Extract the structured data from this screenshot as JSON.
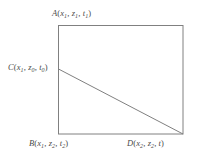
{
  "figure": {
    "type": "geometry-diagram",
    "background_color": "#ffffff",
    "stroke_color": "#808080",
    "text_color": "#4a4a4a",
    "width": 201,
    "height": 162,
    "rectangle": {
      "name": "bounding-rectangle",
      "left": 58,
      "top": 25,
      "right": 183,
      "bottom": 134,
      "stroke_width": 1
    },
    "diagonal": {
      "name": "diagonal-segment-CD",
      "from": {
        "point": "C",
        "x": 58,
        "y": 69
      },
      "to": {
        "point": "D",
        "x": 183,
        "y": 134
      },
      "stroke_width": 1
    },
    "vertices": [
      {
        "id": "A",
        "name": "vertex-label-A",
        "letter": "A",
        "position": "top-left-above",
        "coords": [
          {
            "var": "x",
            "sub": "1"
          },
          {
            "var": "z",
            "sub": "1"
          },
          {
            "var": "t",
            "sub": "1"
          }
        ],
        "text": "A(x1, z1, t1)"
      },
      {
        "id": "C",
        "name": "vertex-label-C",
        "letter": "C",
        "position": "left-edge",
        "coords": [
          {
            "var": "x",
            "sub": "1"
          },
          {
            "var": "z",
            "sub": "0"
          },
          {
            "var": "t",
            "sub": "0"
          }
        ],
        "text": "C(x1, z0, t0)"
      },
      {
        "id": "B",
        "name": "vertex-label-B",
        "letter": "B",
        "position": "bottom-left-below",
        "coords": [
          {
            "var": "x",
            "sub": "1"
          },
          {
            "var": "z",
            "sub": "2"
          },
          {
            "var": "t",
            "sub": "2"
          }
        ],
        "text": "B(x1, z2, t2)"
      },
      {
        "id": "D",
        "name": "vertex-label-D",
        "letter": "D",
        "position": "bottom-right-below",
        "coords": [
          {
            "var": "x",
            "sub": "2"
          },
          {
            "var": "z",
            "sub": "2"
          },
          {
            "var": "t",
            "sub": ""
          }
        ],
        "text": "D(x2, z2, t)"
      }
    ]
  }
}
